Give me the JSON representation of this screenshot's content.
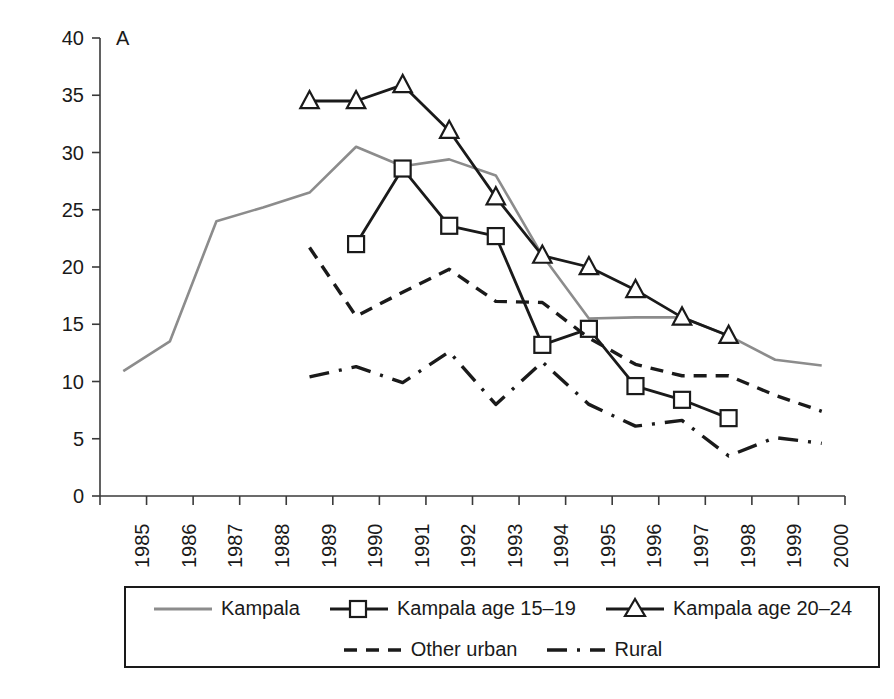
{
  "panel": {
    "letter": "A"
  },
  "axes": {
    "ylabel": "HIV prevalence (%)",
    "yticks": [
      "40",
      "35",
      "30",
      "25",
      "20",
      "15",
      "10",
      "5",
      "0"
    ],
    "xticks": [
      "1985",
      "1986",
      "1987",
      "1988",
      "1989",
      "1990",
      "1991",
      "1992",
      "1993",
      "1994",
      "1995",
      "1996",
      "1997",
      "1998",
      "1999",
      "2000"
    ]
  },
  "legend": {
    "rows": [
      [
        {
          "label": "Kampala",
          "marker": "none",
          "dash": "solid",
          "color": "#8c8c8c"
        },
        {
          "label": "Kampala age 15–19",
          "marker": "square",
          "dash": "solid",
          "color": "#1a1a1a"
        },
        {
          "label": "Kampala age 20–24",
          "marker": "triangle",
          "dash": "solid",
          "color": "#1a1a1a"
        }
      ],
      [
        {
          "label": "Other urban",
          "marker": "none",
          "dash": "dashed",
          "color": "#1a1a1a"
        },
        {
          "label": "Rural",
          "marker": "none",
          "dash": "dashdot",
          "color": "#1a1a1a"
        }
      ]
    ]
  },
  "colors": {
    "kampala": "#8c8c8c",
    "kampala_15_19": "#1a1a1a",
    "kampala_20_24": "#1a1a1a",
    "other_urban": "#1a1a1a",
    "rural": "#1a1a1a",
    "axis": "#3a3a3a"
  },
  "chart_data": {
    "type": "line",
    "title": "",
    "xlabel": "",
    "ylabel": "HIV prevalence (%)",
    "xlim": [
      1985,
      2000
    ],
    "ylim": [
      0,
      40
    ],
    "ytick_step": 5,
    "grid": false,
    "legend_position": "bottom",
    "x": [
      1985,
      1986,
      1987,
      1988,
      1989,
      1990,
      1991,
      1992,
      1993,
      1994,
      1995,
      1996,
      1997,
      1998,
      1999,
      2000
    ],
    "series": [
      {
        "name": "Kampala",
        "marker": "none",
        "dash": "solid",
        "color": "#8c8c8c",
        "x": [
          1985,
          1986,
          1987,
          1988,
          1989,
          1990,
          1991,
          1992,
          1993,
          1994,
          1995,
          1996,
          1997,
          1998,
          1999,
          2000
        ],
        "values": [
          10.9,
          13.5,
          24.0,
          25.2,
          26.5,
          30.5,
          28.8,
          29.4,
          28.0,
          21.0,
          15.5,
          15.6,
          15.6,
          14.0,
          11.9,
          11.4
        ]
      },
      {
        "name": "Kampala age 15–19",
        "marker": "square",
        "dash": "solid",
        "color": "#1a1a1a",
        "x": [
          1990,
          1991,
          1992,
          1993,
          1994,
          1995,
          1996,
          1997,
          1998
        ],
        "values": [
          22.0,
          28.6,
          23.6,
          22.7,
          13.2,
          14.6,
          9.6,
          8.4,
          6.8
        ]
      },
      {
        "name": "Kampala age 20–24",
        "marker": "triangle",
        "dash": "solid",
        "color": "#1a1a1a",
        "x": [
          1989,
          1990,
          1991,
          1992,
          1993,
          1994,
          1995,
          1996,
          1997,
          1998
        ],
        "values": [
          34.5,
          34.5,
          35.9,
          31.9,
          26.1,
          21.0,
          20.0,
          18.0,
          15.6,
          14.0
        ]
      },
      {
        "name": "Other urban",
        "marker": "none",
        "dash": "dashed",
        "color": "#1a1a1a",
        "x": [
          1989,
          1990,
          1991,
          1992,
          1993,
          1994,
          1995,
          1996,
          1997,
          1998,
          1999,
          2000
        ],
        "values": [
          21.7,
          15.7,
          17.8,
          19.8,
          17.0,
          16.9,
          13.8,
          11.5,
          10.5,
          10.5,
          8.8,
          7.4
        ]
      },
      {
        "name": "Rural",
        "marker": "none",
        "dash": "dashdot",
        "color": "#1a1a1a",
        "x": [
          1989,
          1990,
          1991,
          1992,
          1993,
          1994,
          1995,
          1996,
          1997,
          1998,
          1999,
          2000
        ],
        "values": [
          10.4,
          11.3,
          9.9,
          12.6,
          8.0,
          11.7,
          8.0,
          6.1,
          6.6,
          3.5,
          5.1,
          4.6
        ]
      }
    ]
  }
}
